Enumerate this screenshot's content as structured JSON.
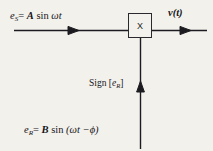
{
  "figure": {
    "type": "block-diagram",
    "background_color": "#f3f1ec",
    "ink_color": "#1c1c20"
  },
  "blocks": [
    {
      "id": "multiplier",
      "symbol": "X",
      "shape": "square",
      "x": 128,
      "y": 13,
      "width": 24,
      "height": 25
    }
  ],
  "labels": {
    "input_signal": {
      "prefix": "e",
      "subscript": "S",
      "equals": "=",
      "amplitude": "A",
      "expression": "sin",
      "argument": "ωt",
      "full_text": "e_S = A sin ωt"
    },
    "output_signal": {
      "variable": "v",
      "argument": "(t)",
      "full_text": "v(t)"
    },
    "sign_reference": {
      "function": "Sign",
      "open_bracket": "[",
      "prefix": "e",
      "subscript": "R",
      "close_bracket": "]",
      "full_text": "Sign [e_R]"
    },
    "reference_signal": {
      "prefix": "e",
      "subscript": "R",
      "equals": "=",
      "amplitude": "B",
      "expression": "sin",
      "argument": "(ωt −ϕ)",
      "full_text": "e_R = B sin (ωt −ϕ)"
    }
  },
  "wires": [
    {
      "id": "input-wire",
      "orientation": "horizontal",
      "from": [
        14,
        30
      ],
      "to": [
        128,
        30
      ],
      "arrowhead_at": [
        77,
        30
      ],
      "direction": "right"
    },
    {
      "id": "output-wire",
      "orientation": "horizontal",
      "from": [
        152,
        30
      ],
      "to": [
        206,
        30
      ],
      "arrowhead_at": [
        190,
        30
      ],
      "direction": "right"
    },
    {
      "id": "sign-wire",
      "orientation": "vertical",
      "from": [
        140,
        148
      ],
      "to": [
        140,
        38
      ],
      "arrowhead_at": [
        140,
        82
      ],
      "direction": "up"
    }
  ]
}
